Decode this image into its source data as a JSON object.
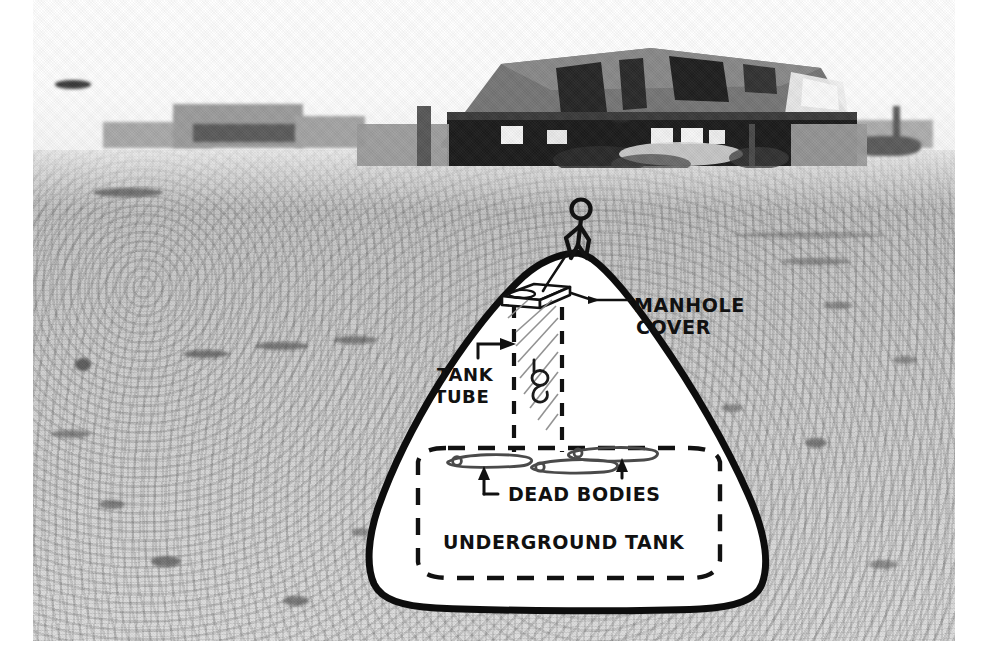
{
  "image": {
    "kind": "annotated-photograph",
    "subject": "Desert site with ruined building and hand-drawn cutaway of an underground tank",
    "plate": {
      "border_color": "#ffffff",
      "photo_left": 33,
      "photo_top": 0,
      "photo_width": 922,
      "photo_height": 641
    },
    "palette": {
      "ink": "#111111",
      "ground_light": "#dedede",
      "ground_mid": "#cfcfcf",
      "ground_dark": "#b9b9b9",
      "building_dark": "#2b2b2b",
      "building_mid": "#7a7a7a",
      "sky": "#ffffff"
    }
  },
  "photo": {
    "sky_note": "blank white overexposed sky",
    "horizon_structures": [
      {
        "name": "low-wall-left"
      },
      {
        "name": "distant-block-left"
      },
      {
        "name": "distant-block-right"
      },
      {
        "name": "utility-pole-right"
      }
    ],
    "building": {
      "name": "ruined-building",
      "description": "burned-out single-storey building with pitched roof, collapsed sections and dark window openings",
      "windows": 5
    },
    "sky_marks": [
      {
        "name": "sky-smudge-left"
      },
      {
        "name": "sky-smudge-right"
      }
    ]
  },
  "annotations": {
    "labels": [
      {
        "id": "manhole",
        "text_line_1": "MANHOLE",
        "text_line_2": "COVER"
      },
      {
        "id": "tank_tube",
        "text_line_1": "TANK",
        "text_line_2": "TUBE"
      },
      {
        "id": "dead_bodies",
        "text": "DEAD BODIES"
      },
      {
        "id": "underground_tank",
        "text": "UNDERGROUND TANK"
      }
    ],
    "elements": [
      {
        "name": "mound-outline",
        "style": "thick solid black freehand outline"
      },
      {
        "name": "manhole-cover-slab",
        "style": "perspective parallelogram slab"
      },
      {
        "name": "tank-tube",
        "style": "vertical dashed shaft with diagonal hatching"
      },
      {
        "name": "descending-figure",
        "style": "small figure inside the tube"
      },
      {
        "name": "underground-tank-outline",
        "style": "large dashed rounded rectangle"
      },
      {
        "name": "dead-body-shapes",
        "count": 3,
        "style": "elongated freehand outlines"
      },
      {
        "name": "leader-arrow-manhole"
      },
      {
        "name": "leader-arrow-tank-tube"
      },
      {
        "name": "leader-arrow-bodies-left"
      },
      {
        "name": "leader-arrow-bodies-right"
      }
    ],
    "stick_figure": {
      "name": "person-standing-on-mound",
      "style": "hand-drawn stick figure with round head"
    }
  }
}
